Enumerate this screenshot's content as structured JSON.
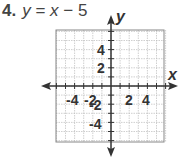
{
  "problem": {
    "number": "4.",
    "equation_lhs": "y",
    "equation_eq": " = ",
    "equation_var": "x",
    "equation_rest": " − 5"
  },
  "colors": {
    "axis": "#333333",
    "grid_minor": "#bbbbbb",
    "border": "#888888",
    "text": "#333333"
  },
  "chart_data": {
    "type": "line",
    "xlabel": "x",
    "ylabel": "y",
    "xlim": [
      -6,
      6
    ],
    "ylim": [
      -6,
      6
    ],
    "grid": true,
    "x_ticks": [
      -4,
      -2,
      2,
      4
    ],
    "y_ticks": [
      4,
      2,
      -2,
      -4
    ],
    "x_tick_labels": [
      "-4",
      "-2",
      "2",
      "4"
    ],
    "y_tick_labels": [
      "4",
      "2",
      "-2",
      "-4"
    ],
    "series": [],
    "note": "Blank coordinate grid for graphing y = x − 5; no line plotted"
  }
}
